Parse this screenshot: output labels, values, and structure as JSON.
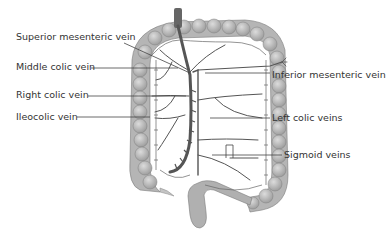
{
  "diagram": {
    "labels": {
      "superior_mesenteric": "Superior mesenteric vein",
      "middle_colic": "Middle colic vein",
      "right_colic": "Right colic vein",
      "ileocolic": "Ileocolic vein",
      "inferior_mesenteric": "Inferior mesenteric vein",
      "left_colic": "Left colic veins",
      "sigmoid": "Sigmoid veins"
    },
    "colors": {
      "colon": "#b8b8b8",
      "colon_shade": "#8e8e8e",
      "vein": "#555555",
      "leader": "#444444",
      "text": "#333333"
    }
  }
}
